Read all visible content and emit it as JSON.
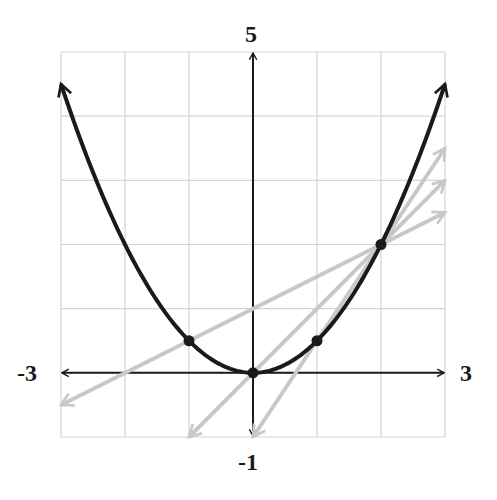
{
  "chart_data": {
    "type": "line",
    "title": "",
    "xlabel": "",
    "ylabel": "",
    "xlim": [
      -3,
      3
    ],
    "ylim": [
      -1,
      5
    ],
    "grid": true,
    "axis_end_labels": {
      "x_min": "-3",
      "x_max": "3",
      "y_max": "5",
      "y_min": "-1"
    },
    "function": "y = x^2 / 2",
    "series": [
      {
        "name": "parabola",
        "kind": "curve",
        "color": "#1a1a1a",
        "x": [
          -3,
          -2,
          -1,
          0,
          1,
          2,
          3
        ],
        "y": [
          4.5,
          2,
          0.5,
          0,
          0.5,
          2,
          4.5
        ]
      },
      {
        "name": "secant-slope-0.5",
        "kind": "secant",
        "color": "#c8c8c8",
        "through": [
          [
            -1,
            0.5
          ],
          [
            2,
            2
          ]
        ],
        "slope": 0.5,
        "from": [
          -3,
          -0.5
        ],
        "to": [
          3,
          2.5
        ]
      },
      {
        "name": "secant-slope-1",
        "kind": "secant",
        "color": "#c8c8c8",
        "through": [
          [
            0,
            0
          ],
          [
            2,
            2
          ]
        ],
        "slope": 1,
        "from": [
          -1,
          -1
        ],
        "to": [
          3,
          3
        ]
      },
      {
        "name": "secant-slope-1.5",
        "kind": "secant",
        "color": "#c8c8c8",
        "through": [
          [
            1,
            0.5
          ],
          [
            2,
            2
          ]
        ],
        "slope": 1.5,
        "from": [
          0,
          -1
        ],
        "to": [
          3,
          3.5
        ]
      }
    ],
    "points": [
      [
        -1,
        0.5
      ],
      [
        0,
        0
      ],
      [
        1,
        0.5
      ],
      [
        2,
        2
      ]
    ]
  },
  "colors": {
    "curve": "#1a1a1a",
    "secant": "#c8c8c8",
    "grid": "#d4d4d4",
    "axis": "#1a1a1a"
  }
}
